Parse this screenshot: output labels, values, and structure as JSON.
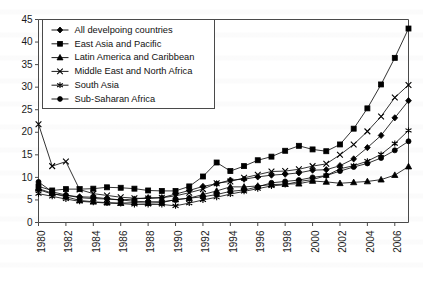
{
  "chart_data": {
    "type": "line",
    "title": "",
    "subtitle": "",
    "xlabel": "",
    "ylabel": "",
    "xlim": [
      1980,
      2007
    ],
    "ylim": [
      0,
      45
    ],
    "ytick_step": 5,
    "xtick_step": 2,
    "grid": false,
    "legend_position": "top-left",
    "yticks": [
      "0",
      "5",
      "10",
      "15",
      "20",
      "25",
      "30",
      "35",
      "40",
      "45"
    ],
    "xticks": [
      "1980",
      "1982",
      "1984",
      "1986",
      "1988",
      "1990",
      "1992",
      "1994",
      "1996",
      "1998",
      "2000",
      "2002",
      "2004",
      "2006"
    ],
    "x": [
      1980,
      1981,
      1982,
      1983,
      1984,
      1985,
      1986,
      1987,
      1988,
      1989,
      1990,
      1991,
      1992,
      1993,
      1994,
      1995,
      1996,
      1997,
      1998,
      1999,
      2000,
      2001,
      2002,
      2003,
      2004,
      2005,
      2006,
      2007
    ],
    "series": [
      {
        "name": "All develpoing countries",
        "marker": "diamond",
        "values": [
          7.3,
          6.3,
          6.0,
          5.7,
          5.6,
          5.3,
          5.0,
          5.2,
          5.5,
          5.5,
          6.3,
          7.1,
          8.0,
          8.6,
          9.4,
          9.6,
          10.1,
          10.5,
          10.7,
          11.0,
          11.6,
          11.7,
          12.6,
          14.1,
          16.6,
          19.3,
          23.2,
          27.0
        ]
      },
      {
        "name": "East Asia and Pacific",
        "marker": "square",
        "values": [
          8.0,
          7.1,
          7.4,
          7.4,
          7.5,
          7.8,
          7.7,
          7.5,
          7.1,
          7.0,
          7.0,
          8.0,
          10.2,
          13.3,
          11.4,
          12.5,
          13.8,
          14.6,
          15.9,
          17.0,
          16.2,
          15.8,
          17.3,
          20.8,
          25.3,
          30.6,
          36.5,
          43.0
        ]
      },
      {
        "name": "Latin America and Caribbean",
        "marker": "triangle",
        "values": [
          7.5,
          6.5,
          5.7,
          4.9,
          4.6,
          4.4,
          4.3,
          4.4,
          4.3,
          4.4,
          5.1,
          5.4,
          6.2,
          7.0,
          7.9,
          7.9,
          8.1,
          8.4,
          8.5,
          8.6,
          9.2,
          9.0,
          8.7,
          8.9,
          9.1,
          9.5,
          10.5,
          12.4
        ]
      },
      {
        "name": "Middle East and North Africa",
        "marker": "cross",
        "values": [
          21.8,
          12.5,
          13.5,
          7.3,
          6.4,
          6.0,
          5.6,
          5.4,
          5.3,
          5.5,
          5.9,
          6.6,
          7.4,
          8.7,
          9.1,
          9.9,
          10.6,
          11.3,
          11.4,
          11.8,
          12.5,
          13.0,
          15.0,
          17.3,
          20.2,
          23.5,
          27.7,
          30.5
        ]
      },
      {
        "name": "South Asia",
        "marker": "asterisk",
        "values": [
          6.4,
          5.8,
          5.2,
          4.7,
          4.5,
          4.3,
          4.2,
          4.0,
          4.0,
          4.0,
          3.7,
          4.3,
          5.0,
          5.6,
          6.3,
          6.9,
          7.5,
          8.1,
          8.4,
          9.1,
          9.5,
          10.4,
          11.9,
          12.6,
          13.6,
          15.1,
          17.5,
          20.4
        ]
      },
      {
        "name": "Sub-Saharan Africa",
        "marker": "circle",
        "values": [
          9.0,
          6.8,
          6.1,
          5.5,
          5.3,
          5.2,
          5.0,
          4.7,
          4.6,
          4.6,
          5.0,
          5.4,
          5.7,
          6.2,
          6.9,
          7.2,
          7.9,
          8.8,
          9.1,
          9.4,
          10.0,
          10.4,
          11.4,
          12.3,
          13.1,
          14.3,
          16.0,
          18.0
        ]
      }
    ]
  },
  "legend": {
    "items": [
      {
        "label": "All develpoing countries",
        "marker": "diamond"
      },
      {
        "label": "East Asia and Pacific",
        "marker": "square"
      },
      {
        "label": "Latin America and Caribbean",
        "marker": "triangle"
      },
      {
        "label": "Middle East and North Africa",
        "marker": "cross"
      },
      {
        "label": "South Asia",
        "marker": "asterisk"
      },
      {
        "label": "Sub-Saharan Africa",
        "marker": "circle"
      }
    ]
  },
  "colors": {
    "line": "#000000",
    "axis": "#4a4a4a",
    "text": "#111111",
    "background": "#ffffff"
  }
}
